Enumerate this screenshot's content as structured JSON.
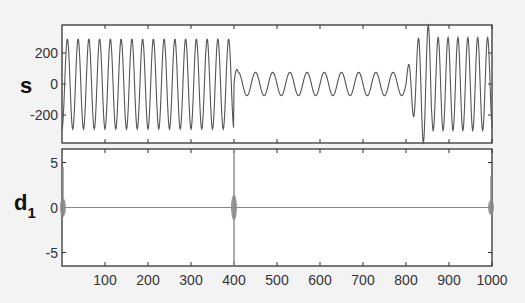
{
  "chart_data": [
    {
      "type": "line",
      "name": "signal",
      "ylabel": "s",
      "xlim": [
        0,
        1000
      ],
      "ylim": [
        -380,
        380
      ],
      "yticks": [
        200,
        0,
        -200
      ],
      "ytick_labels": [
        "200",
        "0",
        "-200"
      ],
      "xticks": [
        100,
        200,
        300,
        400,
        500,
        600,
        700,
        800,
        900,
        1000
      ],
      "xtick_labels": [],
      "segments": [
        {
          "start": 0,
          "end": 400,
          "amplitude": 290,
          "period": 25
        },
        {
          "start": 400,
          "end": 800,
          "amplitude": 75,
          "period": 40
        },
        {
          "start": 800,
          "end": 1000,
          "amplitude": 300,
          "period": 23
        }
      ],
      "line_color": "#555555",
      "grid": false
    },
    {
      "type": "line",
      "name": "detail-coefficient-d1",
      "ylabel": "d",
      "ylabel_subscript": "1",
      "xlim": [
        0,
        1000
      ],
      "ylim": [
        -6.5,
        6.5
      ],
      "yticks": [
        5,
        0,
        -5
      ],
      "ytick_labels": [
        "5",
        "0",
        "-5"
      ],
      "xticks": [
        100,
        200,
        300,
        400,
        500,
        600,
        700,
        800,
        900,
        1000
      ],
      "xtick_labels": [
        "100",
        "200",
        "300",
        "400",
        "500",
        "600",
        "700",
        "800",
        "900",
        "1000"
      ],
      "spikes": [
        {
          "x": 0,
          "min": -1.0,
          "max": 4.5,
          "burst": 0.8
        },
        {
          "x": 400,
          "min": -6.5,
          "max": 6.5,
          "burst": 1.2
        },
        {
          "x": 1000,
          "min": -0.6,
          "max": 3.5,
          "burst": 0.6
        }
      ],
      "baseline": 0,
      "line_color": "#888888",
      "grid": false
    }
  ]
}
